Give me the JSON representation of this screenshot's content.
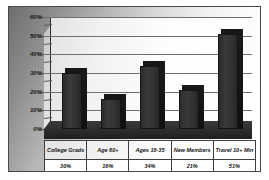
{
  "chart_data": {
    "type": "bar",
    "title": "",
    "xlabel": "",
    "ylabel": "",
    "categories": [
      "College Grads",
      "Age 60+",
      "Ages 18-35",
      "New Members",
      "Travel 10+ Min"
    ],
    "values": [
      30,
      16,
      34,
      21,
      51
    ],
    "value_labels": [
      "30%",
      "16%",
      "34%",
      "21%",
      "51%"
    ],
    "ylim": [
      0,
      60
    ],
    "ytick_labels": [
      "0%",
      "10%",
      "20%",
      "30%",
      "40%",
      "50%",
      "60%"
    ],
    "ytick_values": [
      0,
      10,
      20,
      30,
      40,
      50,
      60
    ],
    "grid": true,
    "legend": false,
    "style": "3d-column",
    "bar_color": "#2f2f2f",
    "plot_background": "#fdfdfd",
    "frame_background": "#bdbdbd"
  },
  "table": {
    "headers": [
      "College Grads",
      "Age 60+",
      "Ages 18-35",
      "New Members",
      "Travel 10+ Min"
    ],
    "values": [
      "30%",
      "16%",
      "34%",
      "21%",
      "51%"
    ]
  }
}
